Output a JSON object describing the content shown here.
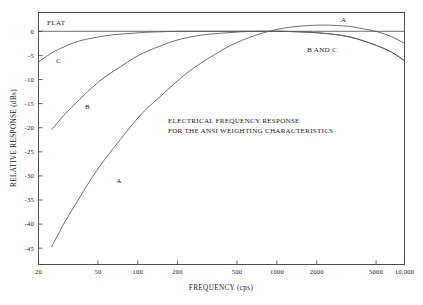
{
  "chart_data": {
    "type": "line",
    "title": "",
    "annotation": [
      "ELECTRICAL FREQUENCY RESPONSE",
      "FOR THE ANSI WEIGHTING CHARACTERISTICS"
    ],
    "xlabel": "FREQUENCY (cps)",
    "ylabel": "RELATIVE RESPONSE (dBs)",
    "xscale": "log",
    "xlim": [
      20,
      10000
    ],
    "ylim": [
      -48,
      3
    ],
    "grid": false,
    "legend": "inline-curve-labels",
    "xticks": [
      20,
      50,
      100,
      200,
      500,
      1000,
      2000,
      5000,
      10000
    ],
    "xticklabels": [
      "20",
      "50",
      "100",
      "200",
      "500",
      "1000",
      "2000",
      "5000",
      "10,000"
    ],
    "yticks": [
      0,
      -5,
      -10,
      -15,
      -20,
      -25,
      -30,
      -35,
      -40,
      -45
    ],
    "yticklabels": [
      "0",
      "-5",
      "-10",
      "-15",
      "-20",
      "-25",
      "-30",
      "-35",
      "-40",
      "-45"
    ],
    "reference_line": {
      "label": "FLAT",
      "y": 0
    },
    "series": [
      {
        "name": "A",
        "label": "A",
        "label_positions": [
          {
            "x": 75,
            "y": -31.5
          },
          {
            "x": 3400,
            "y": 2.0
          }
        ],
        "x": [
          25,
          31.5,
          40,
          50,
          63,
          80,
          100,
          125,
          160,
          200,
          250,
          315,
          400,
          500,
          630,
          800,
          1000,
          1250,
          1600,
          2000,
          2500,
          3150,
          4000,
          5000,
          6300,
          8000,
          10000
        ],
        "y": [
          -44.7,
          -39.4,
          -34.6,
          -30.2,
          -26.2,
          -22.5,
          -19.1,
          -16.1,
          -13.4,
          -10.9,
          -8.6,
          -6.6,
          -4.8,
          -3.2,
          -1.9,
          -0.8,
          0.0,
          0.6,
          1.0,
          1.2,
          1.3,
          1.2,
          1.0,
          0.5,
          -0.1,
          -1.1,
          -2.5
        ]
      },
      {
        "name": "B",
        "label": "B",
        "label_positions": [
          {
            "x": 44,
            "y": -16.2
          }
        ],
        "x": [
          25,
          31.5,
          40,
          50,
          63,
          80,
          100,
          125,
          160,
          200,
          250,
          315,
          400,
          500,
          630,
          800,
          1000,
          1250,
          1600,
          2000,
          2500,
          3150,
          4000,
          5000,
          6300,
          8000,
          10000
        ],
        "y": [
          -20.4,
          -17.1,
          -14.2,
          -11.6,
          -9.3,
          -7.4,
          -5.6,
          -4.2,
          -3.0,
          -2.0,
          -1.3,
          -0.8,
          -0.5,
          -0.3,
          -0.1,
          0.0,
          0.0,
          0.0,
          -0.1,
          -0.2,
          -0.4,
          -0.7,
          -1.2,
          -2.0,
          -3.0,
          -4.3,
          -6.1
        ]
      },
      {
        "name": "C",
        "label": "C",
        "label_positions": [
          {
            "x": 27,
            "y": -6.5
          }
        ],
        "x": [
          20,
          25,
          31.5,
          40,
          50,
          63,
          80,
          100,
          125,
          160,
          200,
          250,
          315,
          400,
          500,
          630,
          800,
          1000,
          1250,
          1600,
          2000,
          2500,
          3150,
          4000,
          5000,
          6300,
          8000,
          10000
        ],
        "y": [
          -6.4,
          -4.5,
          -3.1,
          -2.0,
          -1.4,
          -0.9,
          -0.6,
          -0.4,
          -0.2,
          -0.1,
          0.0,
          0.0,
          0.0,
          0.0,
          0.0,
          0.0,
          0.0,
          0.0,
          0.0,
          -0.1,
          -0.2,
          -0.4,
          -0.7,
          -1.2,
          -2.0,
          -3.0,
          -4.3,
          -6.1
        ]
      }
    ],
    "combined_label": {
      "text": "B AND C",
      "x": 2600,
      "y": -4.3
    }
  }
}
